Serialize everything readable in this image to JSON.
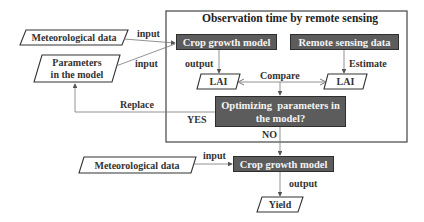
{
  "diagram": {
    "frame_title": "Observation time by remote sensing",
    "nodes": {
      "met_data_top": "Meteorological data",
      "parameters_line1": "Parameters",
      "parameters_line2": "in the model",
      "crop_model_top": "Crop growth model",
      "remote_sensing": "Remote sensing data",
      "lai_left": "LAI",
      "lai_right": "LAI",
      "optimize_line1": "Optimizing  parameters in",
      "optimize_line2": "the model?",
      "met_data_bottom": "Meteorological data",
      "crop_model_bottom": "Crop growth model",
      "yield": "Yield"
    },
    "edge_labels": {
      "input_met": "input",
      "input_params": "input",
      "output_top": "output",
      "estimate": "Estimate",
      "compare": "Compare",
      "replace": "Replace",
      "yes": "YES",
      "no": "NO",
      "input_bottom": "input",
      "output_bottom": "output"
    },
    "colors": {
      "dark_box": "#5c5c5c",
      "line": "#6a6a6a",
      "text": "#333333"
    }
  }
}
